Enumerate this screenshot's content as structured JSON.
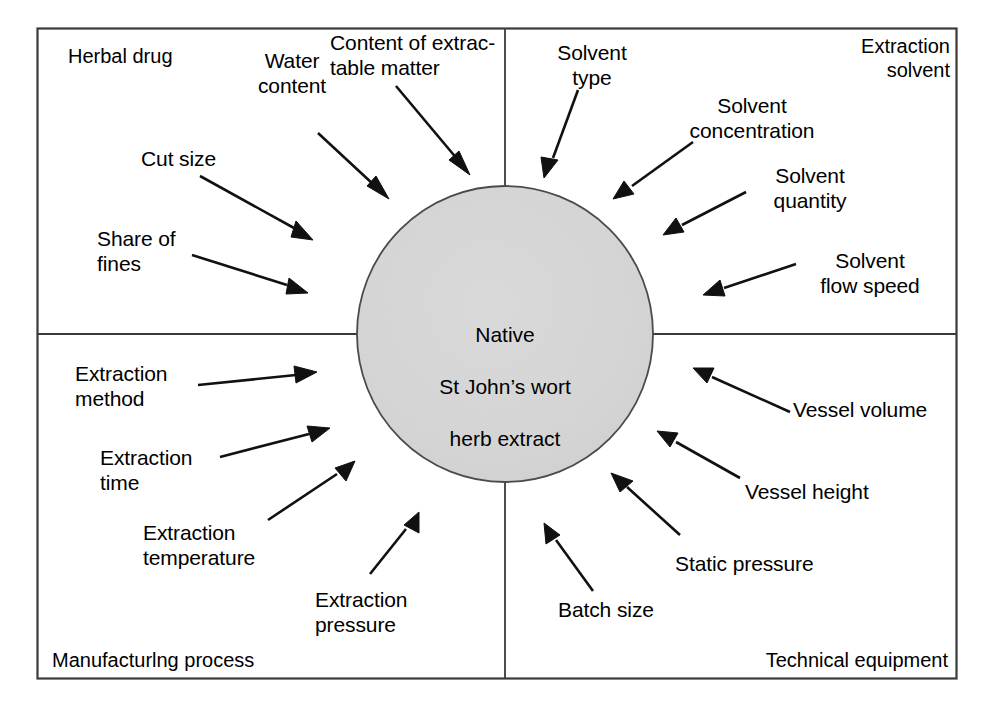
{
  "figure": {
    "type": "ishikawa-cause-and-effect-diagram",
    "center": {
      "line1": "Native",
      "line2": "St John’s wort",
      "line3": "herb extract",
      "full_text": "Native St John’s wort herb extract",
      "fill_color": "#d4d4d4",
      "stroke_color": "#4a4a4a"
    },
    "frame": {
      "border_color": "#3a3a3a",
      "background_color": "#ffffff"
    }
  },
  "quadrants": [
    {
      "id": "herbal-drug",
      "title": "Herbal drug",
      "title_align": "left",
      "position": "top-left",
      "factors": [
        {
          "id": "water-content",
          "label": "Water\ncontent"
        },
        {
          "id": "content-extractable-matter",
          "label": "Content of extrac-\ntable matter"
        },
        {
          "id": "cut-size",
          "label": "Cut size"
        },
        {
          "id": "share-of-fines",
          "label": "Share of\nfines"
        }
      ]
    },
    {
      "id": "extraction-solvent",
      "title": "Extraction\nsolvent",
      "title_align": "right",
      "position": "top-right",
      "factors": [
        {
          "id": "solvent-type",
          "label": "Solvent\ntype"
        },
        {
          "id": "solvent-concentration",
          "label": "Solvent\nconcentration"
        },
        {
          "id": "solvent-quantity",
          "label": "Solvent\nquantity"
        },
        {
          "id": "solvent-flow-speed",
          "label": "Solvent\nflow speed"
        }
      ]
    },
    {
      "id": "manufacturing-process",
      "title": "Manufacturlng process",
      "title_align": "left",
      "position": "bottom-left",
      "factors": [
        {
          "id": "extraction-method",
          "label": "Extraction\nmethod"
        },
        {
          "id": "extraction-time",
          "label": "Extraction\ntime"
        },
        {
          "id": "extraction-temperature",
          "label": "Extraction\ntemperature"
        },
        {
          "id": "extraction-pressure",
          "label": "Extraction\npressure"
        }
      ]
    },
    {
      "id": "technical-equipment",
      "title": "Technical equipment",
      "title_align": "right",
      "position": "bottom-right",
      "factors": [
        {
          "id": "vessel-volume",
          "label": "Vessel volume"
        },
        {
          "id": "vessel-height",
          "label": "Vessel height"
        },
        {
          "id": "static-pressure",
          "label": "Static pressure"
        },
        {
          "id": "batch-size",
          "label": "Batch size"
        }
      ]
    }
  ]
}
